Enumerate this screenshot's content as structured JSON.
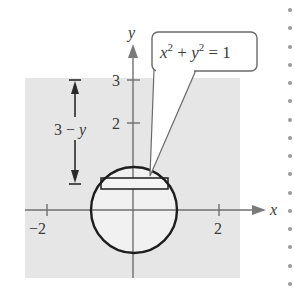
{
  "diagram": {
    "type": "geometry-figure",
    "colors": {
      "shaded_region": "#e6e6e6",
      "axes": "#6f6f6f",
      "curve": "#1e1e1e",
      "text": "#3a3a3a",
      "background": "#ffffff"
    },
    "axes": {
      "x_label": "x",
      "y_label": "y",
      "x_ticks": [
        {
          "value": -2,
          "label": "−2"
        },
        {
          "value": 2,
          "label": "2"
        }
      ],
      "y_ticks": [
        {
          "value": 2,
          "label": "2"
        },
        {
          "value": 3,
          "label": "3"
        }
      ]
    },
    "callout": {
      "text_parts": {
        "x": "x",
        "exp1": "2",
        "plus": " + ",
        "y": "y",
        "exp2": "2",
        "eq": " = 1"
      },
      "equation": "x^2 + y^2 = 1"
    },
    "dimension": {
      "label_num": "3",
      "label_minus": " − ",
      "label_var": "y",
      "label": "3 − y"
    },
    "shapes": {
      "circle": {
        "center": [
          0,
          0
        ],
        "radius": 1
      },
      "rectangle": "horizontal representative strip near top of circle",
      "region_top": 3
    }
  }
}
